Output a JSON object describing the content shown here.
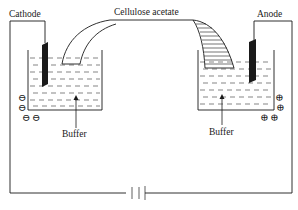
{
  "diagram": {
    "labels": {
      "cathode": "Cathode",
      "anode": "Anode",
      "strip": "Cellulose acetate",
      "buffer_left": "Buffer",
      "buffer_right": "Buffer"
    },
    "charges": {
      "cathode_side": [
        "⊖",
        "⊖",
        "⊖",
        "⊖"
      ],
      "anode_side": [
        "⊕",
        "⊕",
        "⊕",
        "⊕"
      ]
    },
    "components": [
      "cathode electrode",
      "anode electrode",
      "left buffer tank",
      "right buffer tank",
      "cellulose acetate strip",
      "battery / DC power supply",
      "connecting wires"
    ],
    "colors": {
      "line": "#1a1a1a",
      "electrode": "#1a1a1a",
      "background": "#ffffff"
    }
  }
}
